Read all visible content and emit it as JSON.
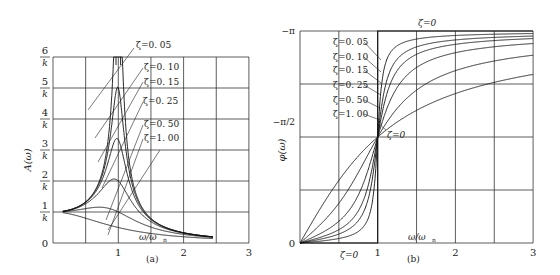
{
  "chart_data": [
    {
      "type": "line",
      "panel_label": "(a)",
      "title": "",
      "xlabel": "ω/ω_n",
      "ylabel": "A(ω)",
      "xlim": [
        0,
        3
      ],
      "ylim": [
        0,
        6
      ],
      "x_ticks": [
        "1",
        "2",
        "3"
      ],
      "y_ticks": [
        "0",
        "1/k",
        "2/k",
        "3/k",
        "4/k",
        "5/k",
        "6/k"
      ],
      "grid": true,
      "series": [
        {
          "name": "ζ=0.05",
          "zeta": 0.05
        },
        {
          "name": "ζ=0.10",
          "zeta": 0.1
        },
        {
          "name": "ζ=0.15",
          "zeta": 0.15
        },
        {
          "name": "ζ=0.25",
          "zeta": 0.25
        },
        {
          "name": "ζ=0.50",
          "zeta": 0.5
        },
        {
          "name": "ζ=1.00",
          "zeta": 1.0
        }
      ],
      "annotations": [
        "ζ=0.05",
        "ζ=0.10",
        "ζ=0.15",
        "ζ=0.25",
        "ζ=0.50",
        "ζ=1.00"
      ]
    },
    {
      "type": "line",
      "panel_label": "(b)",
      "title": "",
      "xlabel": "ω/ω_n",
      "ylabel": "φ(ω)",
      "xlim": [
        0,
        3
      ],
      "ylim": [
        0,
        3.1416
      ],
      "x_ticks": [
        "0",
        "1",
        "2",
        "3"
      ],
      "y_ticks": [
        "0",
        "-π/2",
        "-π"
      ],
      "grid": true,
      "series": [
        {
          "name": "ζ=0.05",
          "zeta": 0.05
        },
        {
          "name": "ζ=0.10",
          "zeta": 0.1
        },
        {
          "name": "ζ=0.15",
          "zeta": 0.15
        },
        {
          "name": "ζ=0.25",
          "zeta": 0.25
        },
        {
          "name": "ζ=0.50",
          "zeta": 0.5
        },
        {
          "name": "ζ=1.00",
          "zeta": 1.0
        }
      ],
      "annotations": [
        "ζ=0.05",
        "ζ=0.10",
        "ζ=0.15",
        "ζ=0.25",
        "ζ=0.50",
        "ζ=1.00",
        "ζ=0",
        "ζ=0",
        "ζ=0"
      ]
    }
  ],
  "left": {
    "ylabel": "A(ω)",
    "xlabel_main": "ω/ω",
    "xlabel_sub": "n",
    "panel": "(a)",
    "y_tick_nums": [
      "1",
      "2",
      "3",
      "4",
      "5",
      "6"
    ],
    "y_tick_den": "k",
    "y_zero": "0",
    "x_ticks": [
      "1",
      "2",
      "3"
    ],
    "labels": [
      "ζ=0. 05",
      "ζ=0. 10",
      "ζ=0. 15",
      "ζ=0. 25",
      "ζ=0. 50",
      "ζ=1. 00"
    ]
  },
  "right": {
    "ylabel": "φ(ω)",
    "xlabel_main": "ω/ω",
    "xlabel_sub": "n",
    "panel": "(b)",
    "y_ticks": [
      "−π",
      "−π/2",
      "0"
    ],
    "x_ticks": [
      "1",
      "2",
      "3"
    ],
    "labels": [
      "ζ=0. 05",
      "ζ=0. 10",
      "ζ=0. 15",
      "ζ=0. 25",
      "ζ=0. 50",
      "ζ=1. 00"
    ],
    "zeta0_top": "ζ=0",
    "zeta0_mid": "ζ=0",
    "zeta0_bottom": "ζ=0"
  }
}
